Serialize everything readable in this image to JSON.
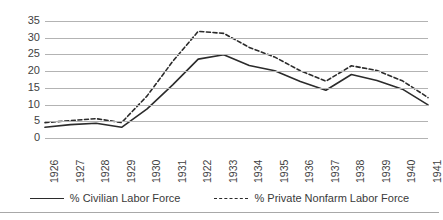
{
  "chart_data": {
    "type": "line",
    "title": "",
    "xlabel": "",
    "ylabel": "",
    "ylim": [
      0,
      35
    ],
    "ytick_step": 5,
    "yticks": [
      35,
      30,
      25,
      20,
      15,
      10,
      5,
      0
    ],
    "grid": true,
    "legend_position": "bottom",
    "categories": [
      "1926",
      "1927",
      "1928",
      "1929",
      "1930",
      "1931",
      "1922",
      "1933",
      "1934",
      "1935",
      "1936",
      "1937",
      "1938",
      "1939",
      "1940",
      "1941"
    ],
    "series": [
      {
        "name": "% Civilian Labor Force",
        "style": "solid",
        "color": "#2b2b2b",
        "values": [
          3.2,
          4.0,
          4.4,
          3.2,
          8.7,
          15.9,
          23.6,
          24.9,
          21.7,
          20.1,
          16.9,
          14.3,
          19.0,
          17.2,
          14.6,
          9.9
        ]
      },
      {
        "name": "% Private Nonfarm Labor Force",
        "style": "dashed",
        "color": "#2b2b2b",
        "values": [
          4.6,
          5.2,
          5.8,
          4.6,
          12.6,
          22.9,
          31.9,
          31.3,
          27.1,
          24.2,
          20.1,
          17.0,
          21.6,
          20.2,
          17.1,
          12.1
        ]
      }
    ]
  },
  "legend": {
    "items": [
      {
        "label": "% Civilian Labor Force",
        "style": "solid"
      },
      {
        "label": "% Private Nonfarm Labor Force",
        "style": "dashed"
      }
    ]
  },
  "axis": {
    "y_ticks": [
      "35",
      "30",
      "25",
      "20",
      "15",
      "10",
      "5",
      "0"
    ],
    "x_ticks": [
      "1926",
      "1927",
      "1928",
      "1929",
      "1930",
      "1931",
      "1922",
      "1933",
      "1934",
      "1935",
      "1936",
      "1937",
      "1938",
      "1939",
      "1940",
      "1941"
    ]
  },
  "colors": {
    "gridline": "#b3b3b3",
    "series_line": "#2b2b2b",
    "text": "#3f3f3f",
    "background": "#ffffff"
  }
}
